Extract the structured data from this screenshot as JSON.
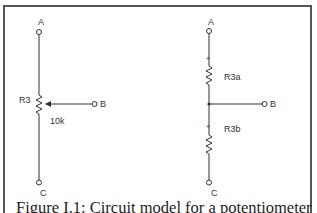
{
  "figure": {
    "caption": "Figure I.1: Circuit model for a potentiometer",
    "left_circuit": {
      "resistor_label": "R3",
      "value_label": "10k",
      "terminals": {
        "top": "A",
        "wiper": "B",
        "bottom": "C"
      }
    },
    "right_circuit": {
      "upper_resistor_label": "R3a",
      "lower_resistor_label": "R3b",
      "polarity_mark": "+",
      "terminals": {
        "top": "A",
        "middle": "B",
        "bottom": "C"
      }
    },
    "colors": {
      "wire": "#333333",
      "border": "#555555"
    }
  }
}
